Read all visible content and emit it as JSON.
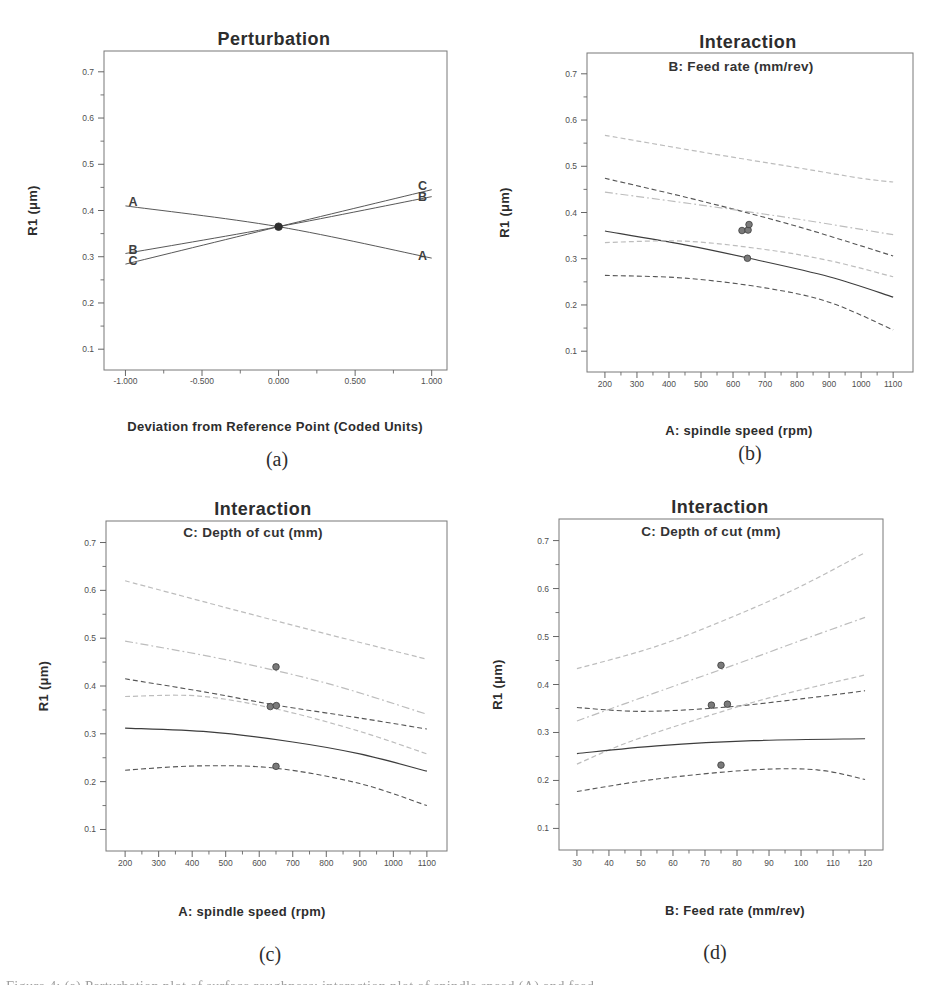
{
  "page": {
    "background": "#ffffff"
  },
  "colors": {
    "dark_line": "#565656",
    "light_line": "#bdbdbd",
    "solid_mean": "#3d3d3d",
    "perturbation_line": "#4f4f4f",
    "point_fill": "#7a7a7a",
    "point_stroke": "#3c3c3c",
    "center_point": "#2f2f2f",
    "axis": "#787878",
    "tick": "#666666",
    "tick_text": "#4f4f4f",
    "text": "#2d2d2d"
  },
  "partial_caption": "Figure 4: (a) Perturbation plot of surface roughness; interaction plot of spindle speed (A) and feed",
  "chart_data": [
    {
      "id": "a",
      "type": "line",
      "panel_label": "(a)",
      "title": "Perturbation",
      "subtitle": null,
      "xlabel": "Deviation from Reference Point (Coded Units)",
      "ylabel": "R1 (μm)",
      "xlim": [
        -1.14,
        1.1
      ],
      "ylim": [
        0.055,
        0.745
      ],
      "grid": false,
      "xticks": [
        {
          "v": -1.0,
          "label": "-1.000"
        },
        {
          "v": -0.5,
          "label": "-0.500"
        },
        {
          "v": 0.0,
          "label": "0.000"
        },
        {
          "v": 0.5,
          "label": "0.500"
        },
        {
          "v": 1.0,
          "label": "1.000"
        }
      ],
      "yticks": [
        {
          "v": 0.1,
          "label": "0.1"
        },
        {
          "v": 0.2,
          "label": "0.2"
        },
        {
          "v": 0.3,
          "label": "0.3"
        },
        {
          "v": 0.4,
          "label": "0.4"
        },
        {
          "v": 0.5,
          "label": "0.5"
        },
        {
          "v": 0.6,
          "label": "0.6"
        },
        {
          "v": 0.7,
          "label": "0.7"
        }
      ],
      "curves": [
        {
          "name": "factor-A-line",
          "shade": "dark",
          "style": "solid",
          "width": 0.95,
          "points": [
            [
              -1,
              0.41
            ],
            [
              0,
              0.365
            ],
            [
              1,
              0.297
            ]
          ]
        },
        {
          "name": "factor-B-line",
          "shade": "dark",
          "style": "solid",
          "width": 0.95,
          "points": [
            [
              -1,
              0.307
            ],
            [
              0,
              0.365
            ],
            [
              1,
              0.43
            ]
          ]
        },
        {
          "name": "factor-C-line",
          "shade": "dark",
          "style": "solid",
          "width": 0.95,
          "points": [
            [
              -1,
              0.284
            ],
            [
              0,
              0.365
            ],
            [
              1,
              0.445
            ]
          ]
        }
      ],
      "points": [
        [
          0,
          0.365
        ]
      ],
      "annotations": [
        {
          "text": "A",
          "x": -0.95,
          "y": 0.418
        },
        {
          "text": "B",
          "x": -0.95,
          "y": 0.314
        },
        {
          "text": "C",
          "x": -0.95,
          "y": 0.291
        },
        {
          "text": "C",
          "x": 0.94,
          "y": 0.453
        },
        {
          "text": "B",
          "x": 0.94,
          "y": 0.429
        },
        {
          "text": "A",
          "x": 0.94,
          "y": 0.301
        }
      ]
    },
    {
      "id": "b",
      "type": "line",
      "panel_label": "(b)",
      "title": "Interaction",
      "subtitle": "B: Feed rate (mm/rev)",
      "xlabel": "A: spindle speed (rpm)",
      "ylabel": "R1 (μm)",
      "xlim": [
        144,
        1162
      ],
      "ylim": [
        0.055,
        0.745
      ],
      "grid": false,
      "xticks": [
        {
          "v": 200,
          "label": "200"
        },
        {
          "v": 300,
          "label": "300"
        },
        {
          "v": 400,
          "label": "400"
        },
        {
          "v": 500,
          "label": "500"
        },
        {
          "v": 600,
          "label": "600"
        },
        {
          "v": 700,
          "label": "700"
        },
        {
          "v": 800,
          "label": "800"
        },
        {
          "v": 900,
          "label": "900"
        },
        {
          "v": 1000,
          "label": "1000"
        },
        {
          "v": 1100,
          "label": "1100"
        }
      ],
      "yticks": [
        {
          "v": 0.1,
          "label": "0.1"
        },
        {
          "v": 0.2,
          "label": "0.2"
        },
        {
          "v": 0.3,
          "label": "0.3"
        },
        {
          "v": 0.4,
          "label": "0.4"
        },
        {
          "v": 0.5,
          "label": "0.5"
        },
        {
          "v": 0.6,
          "label": "0.6"
        },
        {
          "v": 0.7,
          "label": "0.7"
        }
      ],
      "curves": [
        {
          "name": "high-level-upper-ci",
          "shade": "light",
          "style": "dashed",
          "width": 1.2,
          "points": [
            [
              200,
              0.567
            ],
            [
              500,
              0.531
            ],
            [
              800,
              0.497
            ],
            [
              1000,
              0.474
            ],
            [
              1100,
              0.466
            ]
          ]
        },
        {
          "name": "low-level-upper-ci",
          "shade": "dark",
          "style": "dashed",
          "width": 1.1,
          "points": [
            [
              200,
              0.474
            ],
            [
              500,
              0.425
            ],
            [
              800,
              0.37
            ],
            [
              1100,
              0.306
            ]
          ]
        },
        {
          "name": "high-level-mean",
          "shade": "light",
          "style": "dashdot",
          "width": 1.2,
          "points": [
            [
              200,
              0.444
            ],
            [
              500,
              0.416
            ],
            [
              800,
              0.386
            ],
            [
              1100,
              0.352
            ]
          ]
        },
        {
          "name": "low-level-mean",
          "shade": "dark",
          "style": "solid",
          "width": 1.15,
          "points": [
            [
              200,
              0.36
            ],
            [
              450,
              0.33
            ],
            [
              650,
              0.301
            ],
            [
              900,
              0.261
            ],
            [
              1100,
              0.217
            ]
          ]
        },
        {
          "name": "high-level-lower-ci",
          "shade": "light",
          "style": "dashed",
          "width": 1.2,
          "points": [
            [
              200,
              0.335
            ],
            [
              450,
              0.338
            ],
            [
              700,
              0.32
            ],
            [
              900,
              0.296
            ],
            [
              1100,
              0.261
            ]
          ]
        },
        {
          "name": "low-level-lower-ci",
          "shade": "dark",
          "style": "dashed",
          "width": 1.1,
          "points": [
            [
              200,
              0.264
            ],
            [
              450,
              0.258
            ],
            [
              700,
              0.237
            ],
            [
              900,
              0.206
            ],
            [
              1100,
              0.146
            ]
          ]
        }
      ],
      "points": [
        [
          628,
          0.361
        ],
        [
          647,
          0.362
        ],
        [
          650,
          0.374
        ],
        [
          645,
          0.301
        ]
      ],
      "annotations": []
    },
    {
      "id": "c",
      "type": "line",
      "panel_label": "(c)",
      "title": "Interaction",
      "subtitle": "C: Depth of cut (mm)",
      "xlabel": "A: spindle speed (rpm)",
      "ylabel": "R1 (μm)",
      "xlim": [
        143,
        1160
      ],
      "ylim": [
        0.055,
        0.745
      ],
      "grid": false,
      "xticks": [
        {
          "v": 200,
          "label": "200"
        },
        {
          "v": 300,
          "label": "300"
        },
        {
          "v": 400,
          "label": "400"
        },
        {
          "v": 500,
          "label": "500"
        },
        {
          "v": 600,
          "label": "600"
        },
        {
          "v": 700,
          "label": "700"
        },
        {
          "v": 800,
          "label": "800"
        },
        {
          "v": 900,
          "label": "900"
        },
        {
          "v": 1000,
          "label": "1000"
        },
        {
          "v": 1100,
          "label": "1100"
        }
      ],
      "yticks": [
        {
          "v": 0.1,
          "label": "0.1"
        },
        {
          "v": 0.2,
          "label": "0.2"
        },
        {
          "v": 0.3,
          "label": "0.3"
        },
        {
          "v": 0.4,
          "label": "0.4"
        },
        {
          "v": 0.5,
          "label": "0.5"
        },
        {
          "v": 0.6,
          "label": "0.6"
        },
        {
          "v": 0.7,
          "label": "0.7"
        }
      ],
      "curves": [
        {
          "name": "high-level-upper-ci",
          "shade": "light",
          "style": "dashed",
          "width": 1.2,
          "points": [
            [
              200,
              0.62
            ],
            [
              500,
              0.564
            ],
            [
              800,
              0.509
            ],
            [
              1100,
              0.456
            ]
          ]
        },
        {
          "name": "high-level-mean",
          "shade": "light",
          "style": "dashdot",
          "width": 1.2,
          "points": [
            [
              200,
              0.494
            ],
            [
              500,
              0.455
            ],
            [
              800,
              0.406
            ],
            [
              1100,
              0.341
            ]
          ]
        },
        {
          "name": "low-level-upper-ci",
          "shade": "dark",
          "style": "dashed",
          "width": 1.1,
          "points": [
            [
              200,
              0.415
            ],
            [
              450,
              0.386
            ],
            [
              650,
              0.36
            ],
            [
              900,
              0.333
            ],
            [
              1100,
              0.31
            ]
          ]
        },
        {
          "name": "high-level-lower-ci",
          "shade": "light",
          "style": "dashed",
          "width": 1.2,
          "points": [
            [
              200,
              0.378
            ],
            [
              420,
              0.379
            ],
            [
              650,
              0.352
            ],
            [
              900,
              0.305
            ],
            [
              1100,
              0.258
            ]
          ]
        },
        {
          "name": "low-level-mean",
          "shade": "dark",
          "style": "solid",
          "width": 1.15,
          "points": [
            [
              200,
              0.312
            ],
            [
              450,
              0.304
            ],
            [
              700,
              0.283
            ],
            [
              900,
              0.258
            ],
            [
              1100,
              0.222
            ]
          ]
        },
        {
          "name": "low-level-lower-ci",
          "shade": "dark",
          "style": "dashed",
          "width": 1.1,
          "points": [
            [
              200,
              0.224
            ],
            [
              420,
              0.233
            ],
            [
              650,
              0.228
            ],
            [
              900,
              0.196
            ],
            [
              1100,
              0.15
            ]
          ]
        }
      ],
      "points": [
        [
          650,
          0.44
        ],
        [
          633,
          0.357
        ],
        [
          651,
          0.359
        ],
        [
          650,
          0.232
        ]
      ],
      "annotations": []
    },
    {
      "id": "d",
      "type": "line",
      "panel_label": "(d)",
      "title": "Interaction",
      "subtitle": "C: Depth of cut (mm)",
      "xlabel": "B: Feed rate (mm/rev)",
      "ylabel": "R1 (μm)",
      "xlim": [
        24.4,
        125.6
      ],
      "ylim": [
        0.055,
        0.745
      ],
      "grid": false,
      "xticks": [
        {
          "v": 30,
          "label": "30"
        },
        {
          "v": 40,
          "label": "40"
        },
        {
          "v": 50,
          "label": "50"
        },
        {
          "v": 60,
          "label": "60"
        },
        {
          "v": 70,
          "label": "70"
        },
        {
          "v": 80,
          "label": "80"
        },
        {
          "v": 90,
          "label": "90"
        },
        {
          "v": 100,
          "label": "100"
        },
        {
          "v": 110,
          "label": "110"
        },
        {
          "v": 120,
          "label": "120"
        }
      ],
      "yticks": [
        {
          "v": 0.1,
          "label": "0.1"
        },
        {
          "v": 0.2,
          "label": "0.2"
        },
        {
          "v": 0.3,
          "label": "0.3"
        },
        {
          "v": 0.4,
          "label": "0.4"
        },
        {
          "v": 0.5,
          "label": "0.5"
        },
        {
          "v": 0.6,
          "label": "0.6"
        },
        {
          "v": 0.7,
          "label": "0.7"
        }
      ],
      "curves": [
        {
          "name": "high-level-upper-ci",
          "shade": "light",
          "style": "dashed",
          "width": 1.2,
          "points": [
            [
              30,
              0.433
            ],
            [
              55,
              0.48
            ],
            [
              80,
              0.545
            ],
            [
              100,
              0.605
            ],
            [
              120,
              0.675
            ]
          ]
        },
        {
          "name": "high-level-mean",
          "shade": "light",
          "style": "dashdot",
          "width": 1.2,
          "points": [
            [
              30,
              0.324
            ],
            [
              55,
              0.384
            ],
            [
              80,
              0.443
            ],
            [
              100,
              0.492
            ],
            [
              120,
              0.54
            ]
          ]
        },
        {
          "name": "low-level-upper-ci",
          "shade": "dark",
          "style": "dashed",
          "width": 1.1,
          "points": [
            [
              30,
              0.352
            ],
            [
              50,
              0.344
            ],
            [
              75,
              0.352
            ],
            [
              100,
              0.37
            ],
            [
              120,
              0.387
            ]
          ]
        },
        {
          "name": "high-level-lower-ci",
          "shade": "light",
          "style": "dashed",
          "width": 1.2,
          "points": [
            [
              30,
              0.234
            ],
            [
              45,
              0.277
            ],
            [
              65,
              0.322
            ],
            [
              90,
              0.372
            ],
            [
              120,
              0.42
            ]
          ]
        },
        {
          "name": "low-level-mean",
          "shade": "dark",
          "style": "solid",
          "width": 1.15,
          "points": [
            [
              30,
              0.256
            ],
            [
              55,
              0.272
            ],
            [
              85,
              0.283
            ],
            [
              120,
              0.287
            ]
          ]
        },
        {
          "name": "low-level-lower-ci",
          "shade": "dark",
          "style": "dashed",
          "width": 1.1,
          "points": [
            [
              30,
              0.177
            ],
            [
              55,
              0.203
            ],
            [
              85,
              0.222
            ],
            [
              105,
              0.222
            ],
            [
              120,
              0.202
            ]
          ]
        }
      ],
      "points": [
        [
          75,
          0.44
        ],
        [
          72,
          0.357
        ],
        [
          77,
          0.359
        ],
        [
          75,
          0.232
        ]
      ],
      "annotations": []
    }
  ]
}
